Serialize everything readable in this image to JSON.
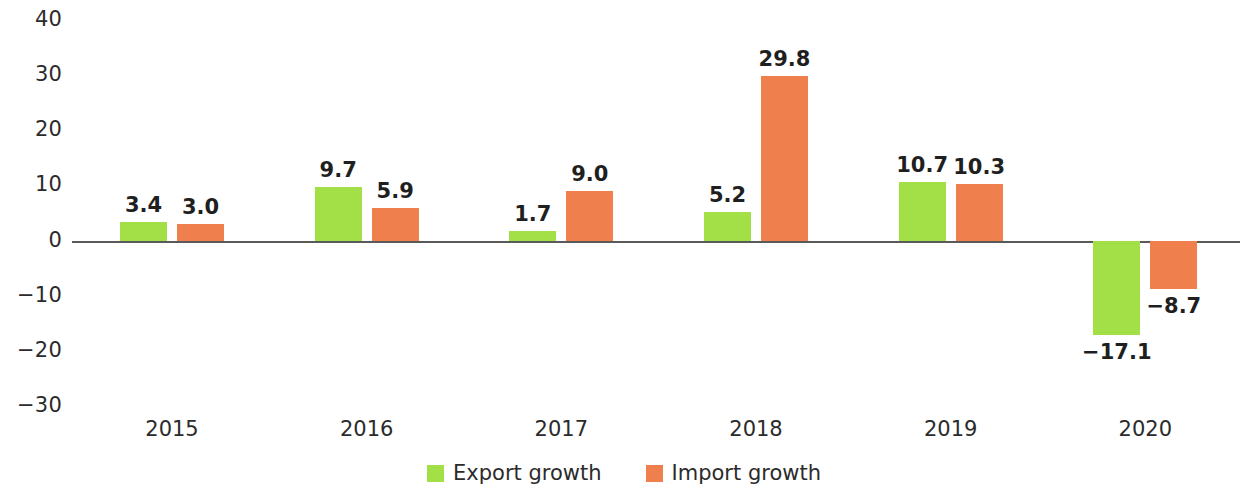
{
  "chart_data": {
    "type": "bar",
    "title": "",
    "subtitle": "",
    "xlabel": "",
    "ylabel": "",
    "categories": [
      "2015",
      "2016",
      "2017",
      "2018",
      "2019",
      "2020"
    ],
    "series": [
      {
        "name": "Export growth",
        "color": "#A3E048",
        "values": [
          3.4,
          9.7,
          1.7,
          5.2,
          10.7,
          -17.1
        ],
        "labels": [
          "3.4",
          "9.7",
          "1.7",
          "5.2",
          "10.7",
          "−17.1"
        ]
      },
      {
        "name": "Import growth",
        "color": "#F07F4E",
        "values": [
          3.0,
          5.9,
          9.0,
          29.8,
          10.3,
          -8.7
        ],
        "labels": [
          "3.0",
          "5.9",
          "9.0",
          "29.8",
          "10.3",
          "−8.7"
        ]
      }
    ],
    "ylim": [
      -30,
      40
    ],
    "y_ticks": [
      40,
      30,
      20,
      10,
      0,
      -10,
      -20,
      -30
    ],
    "y_tick_labels": [
      "40",
      "30",
      "20",
      "10",
      "0",
      "−10",
      "−20",
      "−30"
    ],
    "grid": false,
    "zero_line": true,
    "legend_position": "bottom-center",
    "data_labels": true
  },
  "legend": {
    "items": [
      {
        "label": "Export growth",
        "color": "#A3E048"
      },
      {
        "label": "Import growth",
        "color": "#F07F4E"
      }
    ]
  },
  "axis": {
    "zero_line_color": "#5A5A5A",
    "tick_text_color": "#2B2B2B"
  }
}
